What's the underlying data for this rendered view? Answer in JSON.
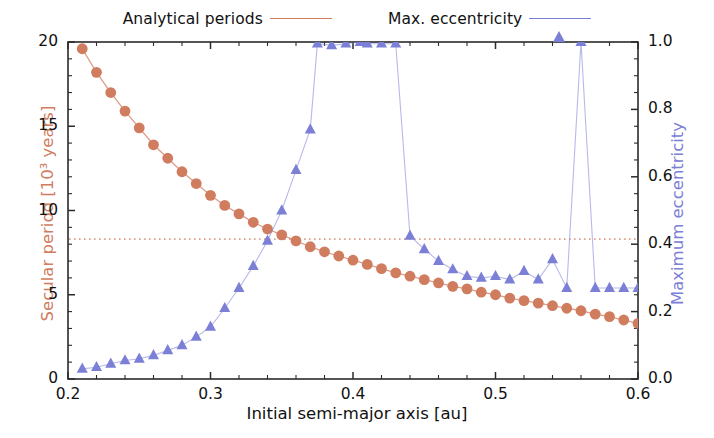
{
  "legend": {
    "position": "above-axes",
    "entries": [
      {
        "label": "Analytical periods",
        "marker": "circle-marker-icon",
        "color": "#d07c5f"
      },
      {
        "label": "Max. eccentricity",
        "marker": "triangle-marker-icon",
        "color": "#7b80d6"
      }
    ]
  },
  "axes": {
    "x_title": "Initial semi-major axis [au]",
    "y_left_title": "Secular period [10³ years]",
    "y_right_title": "Maximum eccentricity",
    "x_ticks": [
      "0.2",
      "0.3",
      "0.4",
      "0.5",
      "0.6"
    ],
    "y_left_ticks": [
      "0",
      "5",
      "10",
      "15",
      "20"
    ],
    "y_right_ticks": [
      "0.0",
      "0.2",
      "0.4",
      "0.6",
      "0.8",
      "1.0"
    ]
  },
  "colors": {
    "analytical_periods": "#d07c5f",
    "max_eccentricity": "#7b80d6",
    "axis": "#2b2b2b",
    "text": "#111111",
    "threshold_line": "#e0a088"
  },
  "chart_data": {
    "type": "line",
    "title": "",
    "xlabel": "Initial semi-major axis [au]",
    "ylabel": "Secular period [10³ years]",
    "ylabel_right": "Maximum eccentricity",
    "xlim": [
      0.2,
      0.6
    ],
    "ylim_left": [
      0,
      20
    ],
    "ylim_right": [
      0.0,
      1.0
    ],
    "grid": false,
    "legend_position": "top-center",
    "x_ticks": [
      0.2,
      0.3,
      0.4,
      0.5,
      0.6
    ],
    "x_minor_tick_step": 0.02,
    "y_left_ticks": [
      0,
      5,
      10,
      15,
      20
    ],
    "y_left_minor_tick_step": 1,
    "y_right_ticks": [
      0.0,
      0.2,
      0.4,
      0.6,
      0.8,
      1.0
    ],
    "y_right_minor_tick_step": 0.05,
    "annotations": [
      {
        "type": "horizontal-dotted-line",
        "axis": "left",
        "value": 8.3,
        "color": "#e0a088",
        "label": ""
      }
    ],
    "series": [
      {
        "name": "Analytical periods",
        "axis": "left",
        "marker": "circle",
        "color": "#d07c5f",
        "unit": "10^3 years",
        "x": [
          0.21,
          0.22,
          0.23,
          0.24,
          0.25,
          0.26,
          0.27,
          0.28,
          0.29,
          0.3,
          0.31,
          0.32,
          0.33,
          0.34,
          0.35,
          0.36,
          0.37,
          0.38,
          0.39,
          0.4,
          0.41,
          0.42,
          0.43,
          0.44,
          0.45,
          0.46,
          0.47,
          0.48,
          0.49,
          0.5,
          0.51,
          0.52,
          0.53,
          0.54,
          0.55,
          0.56,
          0.57,
          0.58,
          0.59,
          0.6
        ],
        "y": [
          19.6,
          18.2,
          17.0,
          15.9,
          14.9,
          13.9,
          13.1,
          12.3,
          11.6,
          10.9,
          10.3,
          9.8,
          9.3,
          8.9,
          8.55,
          8.2,
          7.85,
          7.55,
          7.3,
          7.05,
          6.8,
          6.55,
          6.3,
          6.1,
          5.9,
          5.7,
          5.5,
          5.35,
          5.15,
          5.0,
          4.8,
          4.65,
          4.5,
          4.35,
          4.2,
          4.05,
          3.85,
          3.7,
          3.5,
          3.3
        ]
      },
      {
        "name": "Max. eccentricity",
        "axis": "right",
        "marker": "triangle",
        "color": "#7b80d6",
        "unit": "",
        "x": [
          0.21,
          0.22,
          0.23,
          0.24,
          0.25,
          0.26,
          0.27,
          0.28,
          0.29,
          0.3,
          0.31,
          0.32,
          0.33,
          0.34,
          0.35,
          0.36,
          0.37,
          0.375,
          0.385,
          0.395,
          0.405,
          0.41,
          0.42,
          0.43,
          0.44,
          0.45,
          0.46,
          0.47,
          0.48,
          0.49,
          0.5,
          0.51,
          0.52,
          0.53,
          0.54,
          0.55,
          0.56,
          0.57,
          0.58,
          0.59,
          0.6
        ],
        "y": [
          0.03,
          0.035,
          0.045,
          0.055,
          0.06,
          0.07,
          0.085,
          0.1,
          0.125,
          0.155,
          0.21,
          0.27,
          0.335,
          0.41,
          0.5,
          0.62,
          0.74,
          0.995,
          0.99,
          0.995,
          1.0,
          0.995,
          0.995,
          0.995,
          0.425,
          0.385,
          0.35,
          0.325,
          0.305,
          0.3,
          0.305,
          0.295,
          0.32,
          0.295,
          0.355,
          0.27,
          1.0,
          0.27,
          0.27,
          0.27,
          0.27
        ]
      }
    ]
  }
}
